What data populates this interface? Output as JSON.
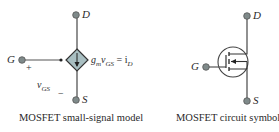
{
  "figures": [
    {
      "id": "small-signal-model",
      "caption": "MOSFET small-signal model",
      "terminals": {
        "drain": "D",
        "gate": "G",
        "source": "S"
      },
      "source_label": "g",
      "source_label_sub": "m",
      "source_label_v": "v",
      "source_label_vsub": "GS",
      "source_label_eq": " = i",
      "source_label_isub": "D",
      "vgs": {
        "v": "v",
        "sub": "GS",
        "plus": "+",
        "minus": "−"
      }
    },
    {
      "id": "circuit-symbol",
      "caption": "MOSFET circuit symbol",
      "terminals": {
        "drain": "D",
        "gate": "G",
        "source": "S"
      }
    }
  ],
  "colors": {
    "line": "#555555",
    "terminal": "#7f8a8a",
    "diamond_fill": "#a9bfc2",
    "text": "#2a2a2a"
  }
}
